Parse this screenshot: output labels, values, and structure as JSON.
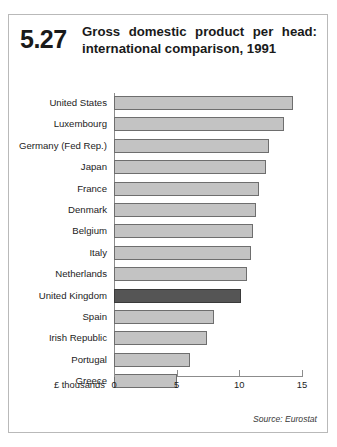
{
  "header": {
    "number": "5.27",
    "title_line1": "Gross domestic product per head:",
    "title_line2": "international comparison, 1991"
  },
  "footer": {
    "source": "Source: Eurostat"
  },
  "axis": {
    "unit_label": "£ thousands",
    "tick_labels": [
      "0",
      "5",
      "10",
      "15"
    ]
  },
  "colors": {
    "bar": "#c3c3c3",
    "bar_border": "#6e6e6e",
    "highlight_bar": "#555555",
    "highlight_bar_border": "#3a3a3a",
    "axis": "#8c8c8c",
    "frame": "#b9b9b9",
    "text": "#1c1c1c"
  },
  "chart_data": {
    "type": "bar",
    "orientation": "horizontal",
    "title": "Gross domestic product per head: international comparison, 1991",
    "subtitle": "5.27",
    "xlabel": "£ thousands",
    "ylabel": "",
    "xlim": [
      0,
      15
    ],
    "xticks": [
      0,
      5,
      10,
      15
    ],
    "grid": false,
    "legend": false,
    "source": "Source: Eurostat",
    "highlight_category": "United Kingdom",
    "categories": [
      "United States",
      "Luxembourg",
      "Germany (Fed Rep.)",
      "Japan",
      "France",
      "Denmark",
      "Belgium",
      "Italy",
      "Netherlands",
      "United Kingdom",
      "Spain",
      "Irish Republic",
      "Portugal",
      "Greece"
    ],
    "values": [
      14.3,
      13.6,
      12.4,
      12.1,
      11.6,
      11.3,
      11.1,
      10.9,
      10.6,
      10.1,
      8.0,
      7.4,
      6.1,
      5.0
    ],
    "series": [
      {
        "name": "GDP per head",
        "values": [
          14.3,
          13.6,
          12.4,
          12.1,
          11.6,
          11.3,
          11.1,
          10.9,
          10.6,
          10.1,
          8.0,
          7.4,
          6.1,
          5.0
        ]
      }
    ]
  }
}
